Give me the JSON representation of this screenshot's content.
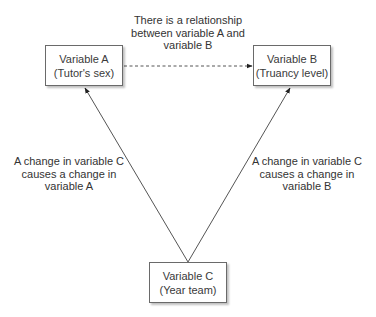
{
  "diagram": {
    "nodes": {
      "a": {
        "title": "Variable A",
        "subtitle": "(Tutor's sex)"
      },
      "b": {
        "title": "Variable B",
        "subtitle": "(Truancy level)"
      },
      "c": {
        "title": "Variable C",
        "subtitle": "(Year team)"
      }
    },
    "edges": {
      "a_b": {
        "style": "dashed",
        "label": [
          "There is a relationship",
          "between variable A and",
          "variable B"
        ]
      },
      "c_a": {
        "style": "solid",
        "label": [
          "A change in variable C",
          "causes a change in",
          "variable A"
        ]
      },
      "c_b": {
        "style": "solid",
        "label": [
          "A change in variable C",
          "causes a change in",
          "variable B"
        ]
      }
    },
    "colors": {
      "line": "#555555",
      "box_border": "#6a6a6a",
      "text": "#333333"
    }
  }
}
